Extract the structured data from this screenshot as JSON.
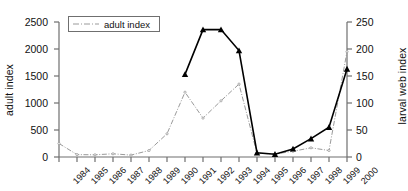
{
  "chart_data": {
    "type": "line",
    "title": "",
    "xlabel": "",
    "categories": [
      "1984",
      "1985",
      "1986",
      "1987",
      "1988",
      "1989",
      "1990",
      "1991",
      "1992",
      "1993",
      "1994",
      "1995",
      "1996",
      "1997",
      "1998",
      "1999",
      "2000"
    ],
    "grid": false,
    "legend_position": "top-left",
    "series": [
      {
        "name": "adult index",
        "axis": "left",
        "ylabel": "adult index",
        "ylim": [
          0,
          2500
        ],
        "yticks": [
          0,
          500,
          1000,
          1500,
          2000,
          2500
        ],
        "color": "#9a9a9a",
        "style": "dash-dot",
        "marker": "small-dot",
        "values": [
          250,
          45,
          40,
          60,
          35,
          120,
          430,
          1200,
          720,
          1040,
          1350,
          70,
          55,
          105,
          170,
          120,
          1950
        ]
      },
      {
        "name": "larval web index",
        "axis": "right",
        "ylabel": "larval web index",
        "ylim": [
          0,
          250
        ],
        "yticks": [
          0,
          50,
          100,
          150,
          200,
          250
        ],
        "color": "#000000",
        "style": "solid",
        "marker": "triangle",
        "values": [
          null,
          null,
          null,
          null,
          null,
          null,
          null,
          153,
          236,
          236,
          197,
          8,
          5,
          15,
          34,
          55,
          163
        ]
      }
    ]
  },
  "axes": {
    "left": {
      "title": "adult index",
      "ticks": [
        "2500",
        "2000",
        "1500",
        "1000",
        "500",
        "0"
      ]
    },
    "right": {
      "title": "larval web index",
      "ticks": [
        "250",
        "200",
        "150",
        "100",
        "50",
        "0"
      ]
    },
    "x": {
      "ticks": [
        "1984",
        "1985",
        "1986",
        "1987",
        "1988",
        "1989",
        "1990",
        "1991",
        "1992",
        "1993",
        "1994",
        "1995",
        "1996",
        "1997",
        "1998",
        "1999",
        "2000"
      ]
    }
  },
  "legend": {
    "items": [
      {
        "label": "adult index",
        "color": "#9a9a9a",
        "style": "dash-dot"
      }
    ]
  }
}
